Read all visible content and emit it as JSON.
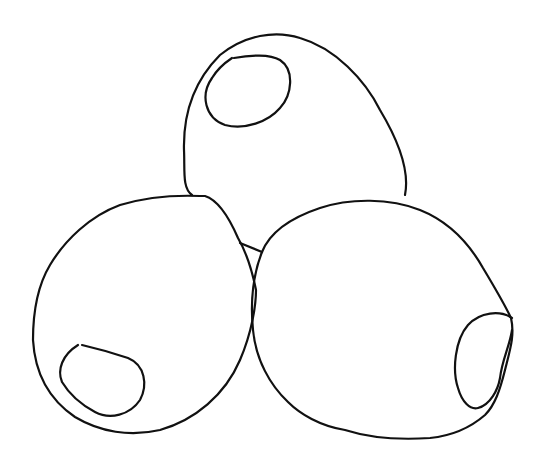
{
  "illustration": {
    "subject": "three olives line drawing",
    "stroke_color": "#111111",
    "background_color": "#ffffff",
    "objects": [
      {
        "name": "top-olive",
        "has_pimento": true
      },
      {
        "name": "left-olive",
        "has_pimento": true
      },
      {
        "name": "right-olive",
        "has_pimento": true
      }
    ]
  }
}
